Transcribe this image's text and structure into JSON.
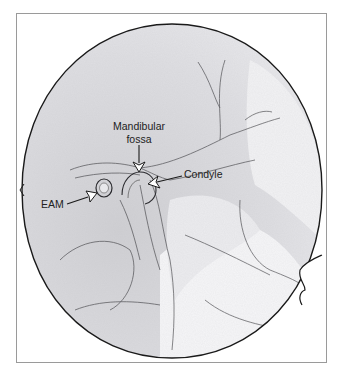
{
  "figure": {
    "type": "lateral radiograph of temporomandibular joint (line illustration)",
    "labels": [
      {
        "id": "mandibular_fossa",
        "line1": "Mandibular",
        "line2": "fossa"
      },
      {
        "id": "condyle",
        "text": "Condyle"
      },
      {
        "id": "eam",
        "text": "EAM"
      }
    ]
  },
  "colors": {
    "frame": "#9a9a9a",
    "circle_outline": "#1a1a1a",
    "radiograph_fill": "#dcdcdf",
    "radiograph_light": "#f4f4f6",
    "label_text": "#222222"
  }
}
